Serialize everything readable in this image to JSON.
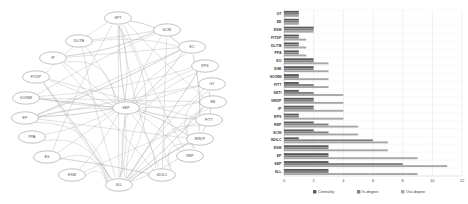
{
  "figure": {
    "left_panel_name": "network-diagram",
    "right_panel_name": "degree-bar-chart"
  },
  "network": {
    "title": "",
    "nodes": [
      {
        "id": "SPT",
        "label": "SPT",
        "x": 118,
        "y": 18
      },
      {
        "id": "SCNI",
        "label": "SCNI",
        "x": 167,
        "y": 30
      },
      {
        "id": "EC",
        "label": "EC",
        "x": 192,
        "y": 47
      },
      {
        "id": "RPS",
        "label": "RPS",
        "x": 205,
        "y": 66
      },
      {
        "id": "GT",
        "label": "GT",
        "x": 212,
        "y": 84
      },
      {
        "id": "EE",
        "label": "EE",
        "x": 213,
        "y": 102
      },
      {
        "id": "FITT",
        "label": "FITT",
        "x": 209,
        "y": 120
      },
      {
        "id": "NRDP",
        "label": "NRDP",
        "x": 200,
        "y": 139
      },
      {
        "id": "REP",
        "label": "REP",
        "x": 190,
        "y": 156
      },
      {
        "id": "SDILC",
        "label": "SDILC",
        "x": 162,
        "y": 175
      },
      {
        "id": "SLL",
        "label": "SLL",
        "x": 119,
        "y": 185
      },
      {
        "id": "ESM",
        "label": "ESM",
        "x": 72,
        "y": 175
      },
      {
        "id": "ES",
        "label": "ES",
        "x": 47,
        "y": 157
      },
      {
        "id": "PPA",
        "label": "PPA",
        "x": 32,
        "y": 137
      },
      {
        "id": "EP",
        "label": "EP",
        "x": 25,
        "y": 118
      },
      {
        "id": "SO/NM",
        "label": "SO/NM",
        "x": 26,
        "y": 98
      },
      {
        "id": "FITDP",
        "label": "FITDP",
        "x": 36,
        "y": 77
      },
      {
        "id": "IP",
        "label": "IP",
        "x": 53,
        "y": 58
      },
      {
        "id": "DL/TB",
        "label": "DL/TB",
        "x": 79,
        "y": 41
      },
      {
        "id": "SEP",
        "label": "SEP",
        "x": 126,
        "y": 108
      }
    ]
  },
  "chart_data": {
    "type": "bar",
    "orientation": "horizontal",
    "title": "",
    "xlabel": "",
    "ylabel": "",
    "xlim": [
      0,
      12
    ],
    "xticks": [
      0,
      2,
      4,
      6,
      8,
      10,
      12
    ],
    "grid": true,
    "legend_position": "bottom",
    "categories": [
      "GT",
      "EE",
      "ESM",
      "FITDP",
      "DL/TB",
      "PPA",
      "EO",
      "ESE",
      "SO/NM",
      "FITT",
      "SETI",
      "NRDP",
      "IP",
      "RPS",
      "REP",
      "SCNI",
      "SDILC",
      "ESM",
      "EP",
      "SEP",
      "SLL"
    ],
    "series": [
      {
        "name": "Centrality",
        "color": "#595959",
        "values": [
          1.0,
          1.0,
          2.0,
          1.0,
          1.0,
          1.0,
          2.0,
          2.0,
          1.0,
          1.0,
          1.0,
          2.0,
          2.0,
          1.0,
          2.0,
          2.0,
          1.0,
          3.0,
          3.0,
          3.0,
          3.0
        ]
      },
      {
        "name": "In-degree",
        "color": "#7f7f7f",
        "values": [
          1.0,
          1.0,
          2.0,
          1.0,
          1.0,
          1.0,
          2.0,
          2.0,
          1.0,
          2.0,
          2.0,
          2.0,
          2.0,
          1.0,
          3.0,
          3.0,
          6.0,
          3.0,
          3.0,
          8.0,
          3.0
        ]
      },
      {
        "name": "Out-degree",
        "color": "#a6a6a6",
        "values": [
          1.0,
          1.0,
          2.0,
          1.5,
          1.5,
          1.5,
          3.0,
          3.0,
          3.0,
          3.0,
          4.0,
          4.0,
          4.0,
          4.0,
          5.0,
          5.0,
          7.0,
          7.0,
          9.0,
          11.0,
          9.0
        ]
      }
    ],
    "legend": [
      {
        "label": "Centrality",
        "color": "#595959"
      },
      {
        "label": "In-degree",
        "color": "#7f7f7f"
      },
      {
        "label": "Out-degree",
        "color": "#a6a6a6"
      }
    ]
  }
}
